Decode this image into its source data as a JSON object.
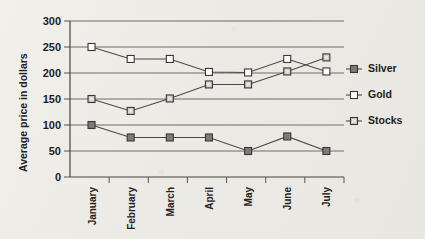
{
  "chart_data": {
    "type": "line",
    "title": "",
    "xlabel": "",
    "ylabel": "Average price in dollars",
    "categories": [
      "January",
      "February",
      "March",
      "April",
      "May",
      "June",
      "July"
    ],
    "ylim": [
      0,
      300
    ],
    "yticks": [
      0,
      50,
      100,
      150,
      200,
      250,
      300
    ],
    "grid": true,
    "legend_position": "right",
    "series": [
      {
        "name": "Silver",
        "values": [
          100,
          76,
          76,
          76,
          50,
          78,
          50
        ],
        "marker": "filled-square",
        "color": "#7d7b78"
      },
      {
        "name": "Gold",
        "values": [
          250,
          227,
          227,
          202,
          201,
          227,
          203
        ],
        "marker": "hollow-square",
        "color": "#ffffff"
      },
      {
        "name": "Stocks",
        "values": [
          150,
          127,
          151,
          178,
          178,
          203,
          230
        ],
        "marker": "light-square",
        "color": "#c9c7c4"
      }
    ]
  },
  "axis": {
    "y_title": "Average price in dollars",
    "y_tick_labels": [
      "300",
      "250",
      "200",
      "150",
      "100",
      "50",
      "0"
    ],
    "x_tick_labels": [
      "January",
      "February",
      "March",
      "April",
      "May",
      "June",
      "July"
    ]
  },
  "legend": {
    "items": [
      {
        "label": "Silver"
      },
      {
        "label": "Gold"
      },
      {
        "label": "Stocks"
      }
    ]
  },
  "colors": {
    "background": "#eeece7",
    "gridline": "#6e6c6a",
    "axis": "#44423f",
    "line": "#4a4845",
    "silver_marker": "#7d7b78",
    "gold_marker": "#ffffff",
    "stocks_marker": "#c9c7c4",
    "text": "#1f1d1b"
  }
}
